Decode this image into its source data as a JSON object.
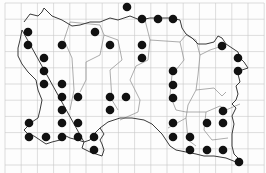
{
  "map": {
    "type": "distribution-grid-map",
    "colors": {
      "background": "#fdfdfd",
      "grid": "#c8c8c8",
      "coast": "#3a3a3a",
      "boundary": "#8a8a8a",
      "dot": "#111111"
    },
    "grid": {
      "x0": 5,
      "y0": 3,
      "spacing": 16.2,
      "cols": 16,
      "rows": 11
    },
    "dots": [
      [
        127,
        7
      ],
      [
        142,
        19
      ],
      [
        158,
        19
      ],
      [
        173,
        19
      ],
      [
        28,
        32
      ],
      [
        95,
        32
      ],
      [
        28,
        45
      ],
      [
        62,
        45
      ],
      [
        110,
        45
      ],
      [
        142,
        45
      ],
      [
        222,
        46
      ],
      [
        44,
        58
      ],
      [
        142,
        58
      ],
      [
        238,
        58
      ],
      [
        44,
        71
      ],
      [
        173,
        71
      ],
      [
        238,
        71
      ],
      [
        44,
        84
      ],
      [
        62,
        84
      ],
      [
        173,
        85
      ],
      [
        62,
        97
      ],
      [
        78,
        97
      ],
      [
        110,
        97
      ],
      [
        126,
        97
      ],
      [
        173,
        98
      ],
      [
        62,
        110
      ],
      [
        110,
        110
      ],
      [
        223,
        111
      ],
      [
        29,
        123
      ],
      [
        62,
        123
      ],
      [
        78,
        123
      ],
      [
        173,
        123
      ],
      [
        207,
        123
      ],
      [
        223,
        123
      ],
      [
        29,
        137
      ],
      [
        46,
        137
      ],
      [
        62,
        137
      ],
      [
        78,
        137
      ],
      [
        94,
        137
      ],
      [
        173,
        137
      ],
      [
        190,
        137
      ],
      [
        94,
        150
      ],
      [
        190,
        150
      ],
      [
        207,
        150
      ],
      [
        223,
        150
      ],
      [
        239,
        162
      ]
    ]
  }
}
